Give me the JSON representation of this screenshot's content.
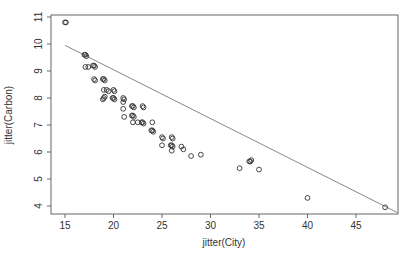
{
  "chart_data": {
    "type": "scatter",
    "title": "",
    "xlabel": "jitter(City)",
    "ylabel": "jitter(Carbon)",
    "xlim": [
      13.7,
      49.5
    ],
    "ylim": [
      3.7,
      11.1
    ],
    "xticks": [
      15,
      20,
      25,
      30,
      35,
      40,
      45
    ],
    "yticks": [
      4,
      5,
      6,
      7,
      8,
      9,
      10,
      11
    ],
    "grid": false,
    "legend": null,
    "points": [
      {
        "x": 15.0,
        "y": 10.8
      },
      {
        "x": 15.1,
        "y": 10.8
      },
      {
        "x": 17.0,
        "y": 9.6
      },
      {
        "x": 17.2,
        "y": 9.55
      },
      {
        "x": 17.1,
        "y": 9.6
      },
      {
        "x": 17.1,
        "y": 9.15
      },
      {
        "x": 17.4,
        "y": 9.15
      },
      {
        "x": 18.0,
        "y": 9.2
      },
      {
        "x": 18.1,
        "y": 9.15
      },
      {
        "x": 17.9,
        "y": 9.2
      },
      {
        "x": 18.0,
        "y": 8.7
      },
      {
        "x": 18.1,
        "y": 8.65
      },
      {
        "x": 19.0,
        "y": 8.7
      },
      {
        "x": 19.1,
        "y": 8.65
      },
      {
        "x": 18.9,
        "y": 8.7
      },
      {
        "x": 19.0,
        "y": 8.3
      },
      {
        "x": 19.3,
        "y": 8.3
      },
      {
        "x": 19.5,
        "y": 8.25
      },
      {
        "x": 19.0,
        "y": 8.0
      },
      {
        "x": 19.1,
        "y": 8.05
      },
      {
        "x": 18.9,
        "y": 7.95
      },
      {
        "x": 20.0,
        "y": 8.3
      },
      {
        "x": 20.1,
        "y": 8.25
      },
      {
        "x": 20.0,
        "y": 8.0
      },
      {
        "x": 20.1,
        "y": 7.95
      },
      {
        "x": 19.9,
        "y": 8.0
      },
      {
        "x": 21.0,
        "y": 8.0
      },
      {
        "x": 21.1,
        "y": 7.95
      },
      {
        "x": 21.0,
        "y": 7.85
      },
      {
        "x": 21.0,
        "y": 7.6
      },
      {
        "x": 21.1,
        "y": 7.3
      },
      {
        "x": 22.0,
        "y": 7.7
      },
      {
        "x": 22.1,
        "y": 7.65
      },
      {
        "x": 21.9,
        "y": 7.7
      },
      {
        "x": 23.0,
        "y": 7.7
      },
      {
        "x": 23.1,
        "y": 7.65
      },
      {
        "x": 22.0,
        "y": 7.35
      },
      {
        "x": 22.1,
        "y": 7.3
      },
      {
        "x": 21.9,
        "y": 7.35
      },
      {
        "x": 22.0,
        "y": 7.1
      },
      {
        "x": 22.5,
        "y": 7.1
      },
      {
        "x": 23.0,
        "y": 7.1
      },
      {
        "x": 23.1,
        "y": 7.05
      },
      {
        "x": 22.9,
        "y": 7.1
      },
      {
        "x": 24.0,
        "y": 7.1
      },
      {
        "x": 24.0,
        "y": 6.8
      },
      {
        "x": 24.1,
        "y": 6.75
      },
      {
        "x": 23.9,
        "y": 6.8
      },
      {
        "x": 25.0,
        "y": 6.55
      },
      {
        "x": 25.1,
        "y": 6.5
      },
      {
        "x": 26.0,
        "y": 6.55
      },
      {
        "x": 26.1,
        "y": 6.5
      },
      {
        "x": 25.0,
        "y": 6.25
      },
      {
        "x": 26.0,
        "y": 6.25
      },
      {
        "x": 26.1,
        "y": 6.2
      },
      {
        "x": 25.9,
        "y": 6.25
      },
      {
        "x": 26.0,
        "y": 6.05
      },
      {
        "x": 27.0,
        "y": 6.2
      },
      {
        "x": 27.2,
        "y": 6.1
      },
      {
        "x": 28.0,
        "y": 5.85
      },
      {
        "x": 29.0,
        "y": 5.9
      },
      {
        "x": 33.0,
        "y": 5.4
      },
      {
        "x": 34.0,
        "y": 5.65
      },
      {
        "x": 34.2,
        "y": 5.7
      },
      {
        "x": 34.1,
        "y": 5.65
      },
      {
        "x": 35.0,
        "y": 5.35
      },
      {
        "x": 40.0,
        "y": 4.3
      },
      {
        "x": 48.0,
        "y": 3.95
      }
    ],
    "fit_line": {
      "x": [
        15.0,
        49.3
      ],
      "y": [
        9.95,
        3.75
      ]
    },
    "colors": {
      "points": "#333333",
      "line": "#888888",
      "axis": "#555555"
    }
  }
}
